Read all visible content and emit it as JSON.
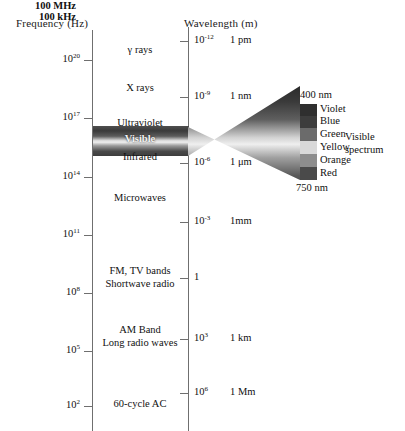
{
  "figure": {
    "frequency_axis_title": "Frequency (Hz)",
    "wavelength_axis_title": "Wavelength (m)"
  },
  "frequency_ticks": [
    {
      "exponent_html": "10<sup>20</sup>",
      "y": 60,
      "side_unit": ""
    },
    {
      "exponent_html": "10<sup>17</sup>",
      "y": 118,
      "side_unit": ""
    },
    {
      "exponent_html": "10<sup>14</sup>",
      "y": 177,
      "side_unit": ""
    },
    {
      "exponent_html": "10<sup>11</sup>",
      "y": 235,
      "side_unit": ""
    },
    {
      "exponent_html": "10<sup>8</sup>",
      "y": 293,
      "side_unit": "100 MHz"
    },
    {
      "exponent_html": "10<sup>5</sup>",
      "y": 351,
      "side_unit": "100 kHz"
    },
    {
      "exponent_html": "10<sup>2</sup>",
      "y": 406,
      "side_unit": ""
    }
  ],
  "wavelength_ticks": [
    {
      "exponent_html": "10<sup>-12</sup>",
      "unit": "1 pm",
      "y": 41
    },
    {
      "exponent_html": "10<sup>-9</sup>",
      "unit": "1 nm",
      "y": 97
    },
    {
      "exponent_html": "10<sup>-6</sup>",
      "unit": "1 μm",
      "y": 163
    },
    {
      "exponent_html": "10<sup>-3</sup>",
      "unit": "1mm",
      "y": 222
    },
    {
      "exponent_html": "1",
      "unit": "",
      "y": 278
    },
    {
      "exponent_html": "10<sup>3</sup>",
      "unit": "1 km",
      "y": 339
    },
    {
      "exponent_html": "10<sup>6</sup>",
      "unit": "1 Mm",
      "y": 393
    }
  ],
  "spectrum_bands": [
    {
      "name": "gamma-rays",
      "label": "γ rays",
      "y": 51,
      "dark": false
    },
    {
      "name": "x-rays",
      "label": "X rays",
      "y": 89,
      "dark": false
    },
    {
      "name": "ultraviolet",
      "label": "Ultraviolet",
      "y": 124,
      "dark": false
    },
    {
      "name": "visible",
      "label": "Visible",
      "y": 140,
      "dark": true
    },
    {
      "name": "infrared",
      "label": "Infrared",
      "y": 158,
      "dark": false
    },
    {
      "name": "microwaves",
      "label": "Microwaves",
      "y": 199,
      "dark": false
    },
    {
      "name": "fm-tv-shortwave",
      "label": "FM, TV bands",
      "y": 272,
      "dark": false
    },
    {
      "name": "shortwave-radio",
      "label": "Shortwave radio",
      "y": 285,
      "dark": false
    },
    {
      "name": "am-band",
      "label": "AM Band",
      "y": 331,
      "dark": false
    },
    {
      "name": "long-radio-waves",
      "label": "Long radio waves",
      "y": 344,
      "dark": false
    },
    {
      "name": "sixty-cycle-ac",
      "label": "60-cycle AC",
      "y": 405,
      "dark": false
    }
  ],
  "visible_detail": {
    "top_wavelength": "400 nm",
    "bottom_wavelength": "750 nm",
    "caption_line1": "Visible",
    "caption_line2": "spectrum",
    "colors": [
      {
        "label": "Violet",
        "hex": "#2f2f2f",
        "height": 12
      },
      {
        "label": "Blue",
        "hex": "#3d3d3d",
        "height": 12
      },
      {
        "label": "Green",
        "hex": "#6b6b6b",
        "height": 13
      },
      {
        "label": "Yellow",
        "hex": "#d9d9d9",
        "height": 13
      },
      {
        "label": "Orange",
        "hex": "#8d8d8d",
        "height": 13
      },
      {
        "label": "Red",
        "hex": "#4a4a4a",
        "height": 13
      }
    ]
  },
  "fan": {
    "stops": [
      {
        "hex": "#2b2b2b",
        "offset": "0%"
      },
      {
        "hex": "#3a3a3a",
        "offset": "14%"
      },
      {
        "hex": "#5f5f5f",
        "offset": "30%"
      },
      {
        "hex": "#d2d2d2",
        "offset": "46%"
      },
      {
        "hex": "#efefef",
        "offset": "52%"
      },
      {
        "hex": "#a0a0a0",
        "offset": "64%"
      },
      {
        "hex": "#595959",
        "offset": "80%"
      },
      {
        "hex": "#333333",
        "offset": "100%"
      }
    ]
  }
}
